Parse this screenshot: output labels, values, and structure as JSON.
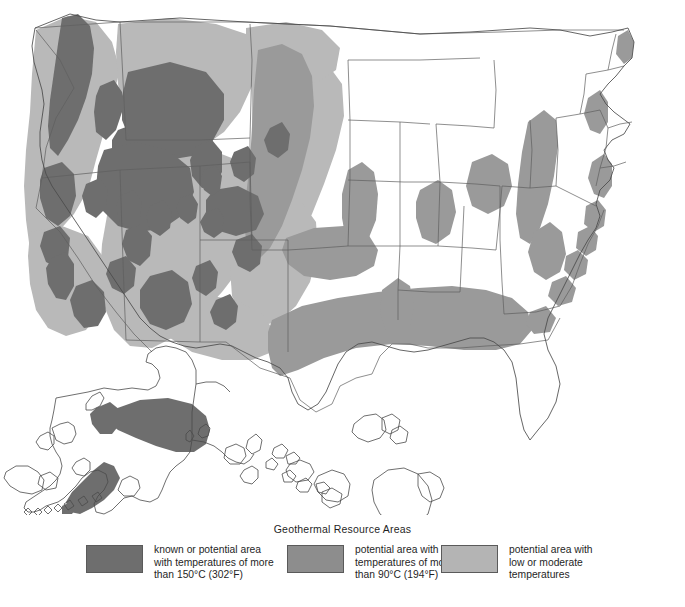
{
  "figure": {
    "title": "Geothermal Resource Areas",
    "background": "#ffffff"
  },
  "colors": {
    "high": "#6e6e6e",
    "medium": "#9a9a9a",
    "low": "#b9b9b9",
    "outline": "#4a4a4a",
    "state_border": "#5e5e5e",
    "land": "#ffffff"
  },
  "legend": {
    "title": "Geothermal Resource Areas",
    "items": [
      {
        "swatch_color": "#6e6e6e",
        "line1": "known or potential area",
        "line2": "with temperatures of more",
        "line3": "than 150°C (302°F)"
      },
      {
        "swatch_color": "#8d8d8d",
        "line1": "potential area with",
        "line2": "temperatures of more",
        "line3": "than 90°C (194°F)"
      },
      {
        "swatch_color": "#b4b4b4",
        "line1": "potential area with",
        "line2": "low or moderate",
        "line3": "temperatures"
      }
    ]
  },
  "map": {
    "name": "united-states-geothermal-map",
    "regions": [
      {
        "name": "conterminous-united-states",
        "label": "Conterminous United States"
      },
      {
        "name": "alaska-inset",
        "label": "Alaska"
      },
      {
        "name": "hawaii-inset",
        "label": "Hawaii"
      }
    ],
    "resource_zones": {
      "high_temperature": [
        "cascade-range-washington",
        "central-idaho-batholith",
        "yellowstone-wyoming",
        "snake-river-plain",
        "nevada-basin-and-range",
        "eastern-california-imperial-valley",
        "southern-new-mexico",
        "southwest-arizona",
        "alaska-interior-belt",
        "alaska-peninsula-aleutians"
      ],
      "medium_temperature": [
        "great-plains-band",
        "gulf-coast-band",
        "appalachian-belt",
        "atlantic-coastal-plain",
        "michigan-basin",
        "illinois-basin",
        "mississippi-embayment"
      ],
      "low_moderate_temperature": [
        "pacific-northwest",
        "columbia-plateau",
        "colorado-plateau",
        "rocky-mountain-front",
        "southern-california",
        "texas-panhandle"
      ]
    }
  }
}
